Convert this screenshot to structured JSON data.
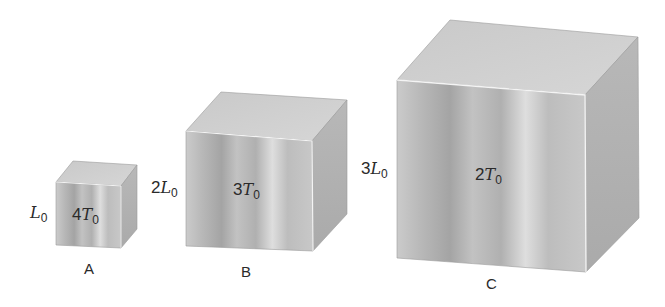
{
  "diagram": {
    "type": "three-cubes-comparison",
    "cubes": [
      {
        "name": "A",
        "side_label": {
          "coef": "",
          "var": "L",
          "sub": "0"
        },
        "temp_label": {
          "coef": "4",
          "var": "T",
          "sub": "0"
        }
      },
      {
        "name": "B",
        "side_label": {
          "coef": "2",
          "var": "L",
          "sub": "0"
        },
        "temp_label": {
          "coef": "3",
          "var": "T",
          "sub": "0"
        }
      },
      {
        "name": "C",
        "side_label": {
          "coef": "3",
          "var": "L",
          "sub": "0"
        },
        "temp_label": {
          "coef": "2",
          "var": "T",
          "sub": "0"
        }
      }
    ],
    "colors": {
      "front_light": "#d8d8d8",
      "front_dark": "#a6a6a6",
      "top": "#cfcfcf",
      "side": "#b3b3b3",
      "edge": "#f2f2f2",
      "text": "#2a2a2a"
    }
  }
}
